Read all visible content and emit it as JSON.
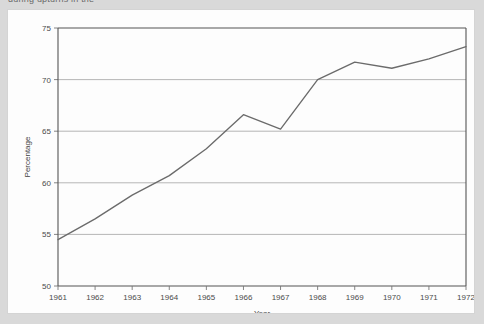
{
  "page": {
    "caption_partial": "during upturns in the",
    "background_color": "#d9d9d9",
    "panel_color": "#fdfdfd"
  },
  "chart_data": {
    "type": "line",
    "title": "",
    "xlabel": "Year",
    "ylabel": "Percentage",
    "x": [
      1961,
      1962,
      1963,
      1964,
      1965,
      1966,
      1967,
      1968,
      1969,
      1970,
      1971,
      1972
    ],
    "categories": [
      "1961",
      "1962",
      "1963",
      "1964",
      "1965",
      "1966",
      "1967",
      "1968",
      "1969",
      "1970",
      "1971",
      "1972"
    ],
    "values": [
      54.5,
      56.5,
      58.8,
      60.7,
      63.3,
      66.6,
      65.2,
      70.0,
      71.7,
      71.1,
      72.0,
      73.2
    ],
    "series": [
      {
        "name": "Percentage",
        "values": [
          54.5,
          56.5,
          58.8,
          60.7,
          63.3,
          66.6,
          65.2,
          70.0,
          71.7,
          71.1,
          72.0,
          73.2
        ],
        "color": "#6b6b6b"
      }
    ],
    "xlim": [
      1961,
      1972
    ],
    "ylim": [
      50,
      75
    ],
    "yticks": [
      50,
      55,
      60,
      65,
      70,
      75
    ],
    "ytick_labels": [
      "50",
      "55",
      "60",
      "65",
      "70",
      "75"
    ],
    "xticks": [
      1961,
      1962,
      1963,
      1964,
      1965,
      1966,
      1967,
      1968,
      1969,
      1970,
      1971,
      1972
    ],
    "xtick_labels": [
      "1961",
      "1962",
      "1963",
      "1964",
      "1965",
      "1966",
      "1967",
      "1968",
      "1969",
      "1970",
      "1971",
      "1972"
    ],
    "grid": true,
    "grid_axis": "y",
    "legend": false,
    "legend_position": "none",
    "line_color": "#6b6b6b",
    "grid_color": "#a9a9a9",
    "axis_color": "#555555"
  }
}
